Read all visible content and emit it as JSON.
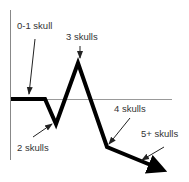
{
  "diagram": {
    "title": "",
    "labels": {
      "zero_one": "0-1 skull",
      "two": "2 skulls",
      "three": "3 skulls",
      "four": "4 skulls",
      "five_plus": "5+ skulls"
    },
    "colors": {
      "line": "#000000",
      "axis": "#888888",
      "text": "#333333"
    }
  }
}
